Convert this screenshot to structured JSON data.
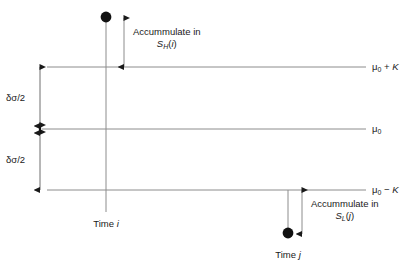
{
  "figure": {
    "type": "cusum-control-chart-schematic",
    "background_color": "#ffffff",
    "line_color": "#8c8c8c",
    "accent_color": "#1a1a1a",
    "levels": [
      {
        "id": "upper",
        "label_prefix": "μ",
        "label_sub": "0",
        "label_suffix": " + K",
        "y": 67
      },
      {
        "id": "center",
        "label_prefix": "μ",
        "label_sub": "0",
        "label_suffix": "",
        "y": 129
      },
      {
        "id": "lower",
        "label_prefix": "μ",
        "label_sub": "0",
        "label_suffix": " − K",
        "y": 190
      }
    ],
    "right_labels": {
      "upper": "μ0 + K",
      "center": "μ0",
      "lower": "μ0 − K"
    },
    "left_brackets": [
      {
        "id": "upper-gap",
        "text_prefix": "δσ/2"
      },
      {
        "id": "lower-gap",
        "text_prefix": "δσ/2"
      }
    ],
    "bracket_label": "δσ/2",
    "annotations": [
      {
        "id": "upper-accumulate",
        "line1": "Accummulate in",
        "line2_prefix": "S",
        "line2_sub": "H",
        "line2_suffix": "(i)"
      },
      {
        "id": "lower-accumulate",
        "line1": "Accummulate in",
        "line2_prefix": "S",
        "line2_sub": "L",
        "line2_suffix": "(j)"
      }
    ],
    "time_markers": [
      {
        "id": "time-i",
        "label_prefix": "Time ",
        "label_italic": "i"
      },
      {
        "id": "time-j",
        "label_prefix": "Time ",
        "label_italic": "j"
      }
    ],
    "axis_labels": {
      "time_i": "Time i",
      "time_j": "Time j"
    }
  }
}
